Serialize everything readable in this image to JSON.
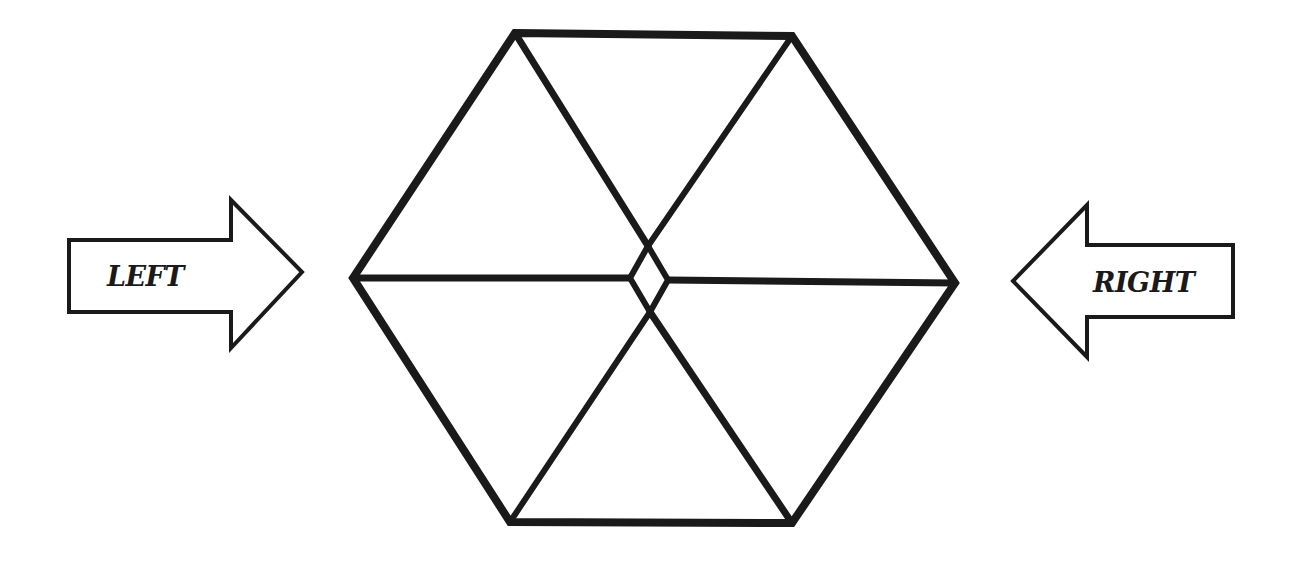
{
  "diagram": {
    "type": "hexagon-with-direction-arrows",
    "background_color": "#ffffff",
    "stroke_color": "#1a1a1a",
    "hexagon": {
      "vertices": {
        "top_left": [
          515,
          33
        ],
        "top_right": [
          792,
          36
        ],
        "right": [
          955,
          283
        ],
        "bottom_right": [
          792,
          523
        ],
        "bottom_left": [
          510,
          522
        ],
        "left": [
          353,
          278
        ]
      },
      "center_diamond": {
        "top": [
          648,
          246
        ],
        "right": [
          668,
          280
        ],
        "bottom": [
          650,
          312
        ],
        "left": [
          630,
          278
        ]
      },
      "segments": 6,
      "stroke_width": 7
    },
    "arrows": {
      "left_arrow": {
        "label": "LEFT",
        "direction": "right",
        "points": [
          [
            69,
            240
          ],
          [
            231,
            240
          ],
          [
            231,
            200
          ],
          [
            302,
            272
          ],
          [
            231,
            348
          ],
          [
            231,
            312
          ],
          [
            69,
            312
          ]
        ]
      },
      "right_arrow": {
        "label": "RIGHT",
        "direction": "left",
        "points": [
          [
            1233,
            245
          ],
          [
            1087,
            245
          ],
          [
            1087,
            205
          ],
          [
            1013,
            281
          ],
          [
            1087,
            357
          ],
          [
            1087,
            317
          ],
          [
            1233,
            317
          ]
        ]
      }
    }
  }
}
